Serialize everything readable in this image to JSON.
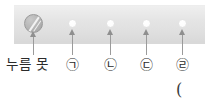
{
  "figure": {
    "bar": {
      "color": "#e2e2e2",
      "name": "metal-bar"
    },
    "tack": {
      "icon": "thumbtack-head-icon",
      "label": "누름 못",
      "x": 33,
      "dot_y": 23
    },
    "markers": [
      {
        "label": "㉠",
        "x": 72,
        "label_x": 66
      },
      {
        "label": "㉡",
        "x": 110,
        "label_x": 104
      },
      {
        "label": "㉢",
        "x": 146,
        "label_x": 140
      },
      {
        "label": "㉣",
        "x": 182,
        "label_x": 176
      }
    ],
    "trailing_paren": "("
  },
  "colors": {
    "bar": "#e2e2e2",
    "dot": "#ffffff",
    "arrow": "#9b9b9b",
    "text": "#2b2b2b",
    "tack": "#b4b4b4"
  }
}
